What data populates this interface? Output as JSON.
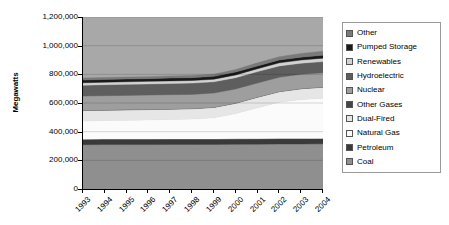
{
  "chart_data": {
    "type": "area",
    "stacked": true,
    "title": "",
    "xlabel": "",
    "ylabel": "Megawatts",
    "ylim": [
      0,
      1200000
    ],
    "ytick_labels": [
      "1,200,000",
      "1,000,000",
      "800,000",
      "600,000",
      "400,000",
      "200,000",
      "0"
    ],
    "ytick_values": [
      1200000,
      1000000,
      800000,
      600000,
      400000,
      200000,
      0
    ],
    "ytick_step": 200000,
    "grid": "horizontal-faint",
    "legend_position": "right",
    "categories": [
      "1993",
      "1994",
      "1995",
      "1996",
      "1997",
      "1998",
      "1999",
      "2000",
      "2001",
      "2002",
      "2003",
      "2004"
    ],
    "x": [
      1993,
      1994,
      1995,
      1996,
      1997,
      1998,
      1999,
      2000,
      2001,
      2002,
      2003,
      2004
    ],
    "series": [
      {
        "name": "Coal",
        "color": "#8f8f8f",
        "values": [
          309000,
          310000,
          310000,
          310000,
          311000,
          311000,
          311000,
          312000,
          313000,
          314000,
          314000,
          315000
        ]
      },
      {
        "name": "Petroleum",
        "color": "#3a3a3a",
        "values": [
          38000,
          38000,
          38000,
          38000,
          38000,
          38000,
          38000,
          38000,
          38000,
          38000,
          38000,
          38000
        ]
      },
      {
        "name": "Natural Gas",
        "color": "#fbfbfb",
        "values": [
          128000,
          130000,
          132000,
          134000,
          136000,
          139000,
          148000,
          176000,
          216000,
          253000,
          272000,
          281000
        ]
      },
      {
        "name": "Dual-Fired",
        "color": "#e6e6e6",
        "values": [
          72000,
          72000,
          72000,
          72000,
          72000,
          72000,
          72000,
          72000,
          73000,
          74000,
          75000,
          76000
        ]
      },
      {
        "name": "Other Gases",
        "color": "#454545",
        "values": [
          2000,
          2000,
          2000,
          2000,
          2000,
          2000,
          2000,
          2000,
          2000,
          2000,
          2000,
          2000
        ]
      },
      {
        "name": "Nuclear",
        "color": "#9e9e9e",
        "values": [
          99000,
          99000,
          99000,
          99000,
          99000,
          98000,
          98000,
          98000,
          98000,
          99000,
          99000,
          99000
        ]
      },
      {
        "name": "Hydroelectric",
        "color": "#5e5e5e",
        "values": [
          76000,
          77000,
          77000,
          78000,
          78000,
          79000,
          79000,
          79000,
          79000,
          79000,
          78000,
          78000
        ]
      },
      {
        "name": "Renewables",
        "color": "#d2d2d2",
        "values": [
          17000,
          17000,
          18000,
          18000,
          18000,
          18000,
          18000,
          19000,
          20000,
          21000,
          22000,
          24000
        ]
      },
      {
        "name": "Pumped Storage",
        "color": "#1a1a1a",
        "values": [
          19000,
          19000,
          19000,
          19000,
          20000,
          20000,
          20000,
          20000,
          20000,
          20000,
          20000,
          20000
        ]
      },
      {
        "name": "Other",
        "color": "#7a7a7a",
        "values": [
          14000,
          14000,
          14000,
          14000,
          15000,
          15000,
          15000,
          17000,
          21000,
          23000,
          26000,
          28000
        ]
      }
    ],
    "totals": [
      774000,
      778000,
      781000,
      784000,
      789000,
      792000,
      801000,
      833000,
      880000,
      923000,
      946000,
      961000
    ],
    "legend_entries": [
      {
        "label": "Other",
        "color": "#7a7a7a"
      },
      {
        "label": "Pumped Storage",
        "color": "#1a1a1a"
      },
      {
        "label": "Renewables",
        "color": "#d2d2d2"
      },
      {
        "label": "Hydroelectric",
        "color": "#5e5e5e"
      },
      {
        "label": "Nuclear",
        "color": "#9e9e9e"
      },
      {
        "label": "Other Gases",
        "color": "#454545"
      },
      {
        "label": "Dual-Fired",
        "color": "#e6e6e6"
      },
      {
        "label": "Natural Gas",
        "color": "#fbfbfb"
      },
      {
        "label": "Petroleum",
        "color": "#3a3a3a"
      },
      {
        "label": "Coal",
        "color": "#8f8f8f"
      }
    ],
    "plot_background": "#a8a8a8"
  }
}
